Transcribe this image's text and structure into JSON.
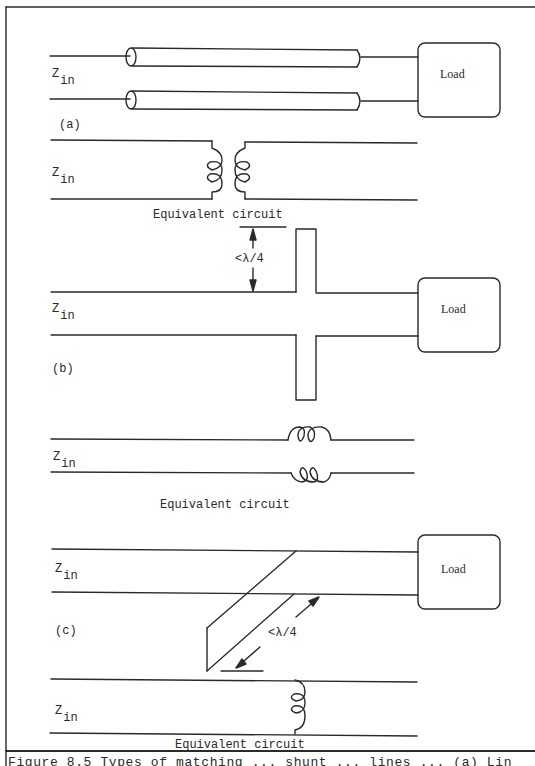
{
  "figure": {
    "panels": [
      {
        "id": "a",
        "label": "(a)",
        "zin_main": "Z",
        "zin_sub": "in",
        "load_label": "Load",
        "equivalent_label": "Equivalent circuit",
        "equivalent_zin_main": "Z",
        "equivalent_zin_sub": "in"
      },
      {
        "id": "b",
        "label": "(b)",
        "zin_main": "Z",
        "zin_sub": "in",
        "load_label": "Load",
        "dimension_label": "<λ/4",
        "equivalent_label": "Equivalent circuit",
        "equivalent_zin_main": "Z",
        "equivalent_zin_sub": "in"
      },
      {
        "id": "c",
        "label": "(c)",
        "zin_main": "Z",
        "zin_sub": "in",
        "load_label": "Load",
        "dimension_label": "<λ/4",
        "equivalent_label": "Equivalent circuit",
        "equivalent_zin_main": "Z",
        "equivalent_zin_sub": "in"
      }
    ],
    "caption": "Figure 8.5  Types of matching ... shunt ... lines ... (a) Lin"
  },
  "colors": {
    "ink": "#2a2a2a",
    "background": "#ffffff"
  }
}
